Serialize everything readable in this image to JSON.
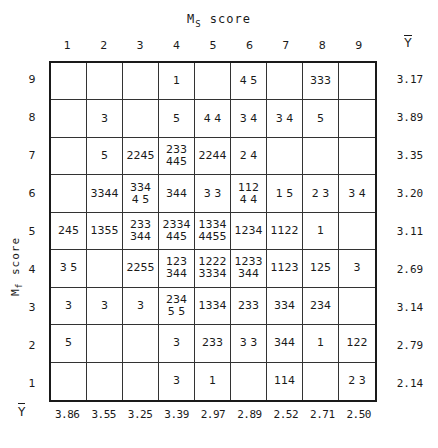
{
  "top_axis": {
    "label_main": "M",
    "label_sub": "S",
    "label_rest": " score"
  },
  "left_axis": {
    "label_main": "M",
    "label_sub": "f",
    "label_rest": " score"
  },
  "mean_symbol": "Y",
  "columns": [
    "1",
    "2",
    "3",
    "4",
    "5",
    "6",
    "7",
    "8",
    "9"
  ],
  "rows": [
    {
      "label": "9",
      "cells": [
        "",
        "",
        "",
        "1",
        "",
        "4 5",
        "",
        "333",
        ""
      ],
      "mean": "3.17"
    },
    {
      "label": "8",
      "cells": [
        "",
        "3",
        "",
        "5",
        "4 4",
        "3 4",
        "3 4",
        "5",
        ""
      ],
      "mean": "3.89"
    },
    {
      "label": "7",
      "cells": [
        "",
        "5",
        "2245",
        "233\n445",
        "2244",
        "2 4",
        "",
        "",
        ""
      ],
      "mean": "3.35"
    },
    {
      "label": "6",
      "cells": [
        "",
        "3344",
        "334\n4 5",
        "344",
        "3 3",
        "112\n4 4",
        "1 5",
        "2 3",
        "3 4"
      ],
      "mean": "3.20"
    },
    {
      "label": "5",
      "cells": [
        "245",
        "1355",
        "233\n344",
        "2334\n445",
        "1334\n4455",
        "1234",
        "1122",
        "1",
        ""
      ],
      "mean": "3.11"
    },
    {
      "label": "4",
      "cells": [
        "3 5",
        "",
        "2255",
        "123\n344",
        "1222\n3334",
        "1233\n344",
        "1123",
        "125",
        "3"
      ],
      "mean": "2.69"
    },
    {
      "label": "3",
      "cells": [
        "3",
        "3",
        "3",
        "234\n5 5",
        "1334",
        "233",
        "334",
        "234",
        ""
      ],
      "mean": "3.14"
    },
    {
      "label": "2",
      "cells": [
        "5",
        "",
        "",
        "3",
        "233",
        "3 3",
        "344",
        "1",
        "122"
      ],
      "mean": "2.79"
    },
    {
      "label": "1",
      "cells": [
        "",
        "",
        "",
        "3",
        "1",
        "",
        "114",
        "",
        "2 3"
      ],
      "mean": "2.14"
    }
  ],
  "column_means": [
    "3.86",
    "3.55",
    "3.25",
    "3.39",
    "2.97",
    "2.89",
    "2.52",
    "2.71",
    "2.50"
  ]
}
